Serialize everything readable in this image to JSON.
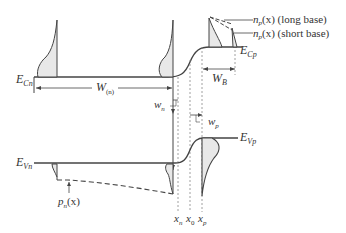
{
  "labels": {
    "ecn_main": "E",
    "ecn_sub": "Cn",
    "ecp_main": "E",
    "ecp_sub": "Cp",
    "evn_main": "E",
    "evn_sub": "Vn",
    "evp_main": "E",
    "evp_sub": "Vp",
    "wn_width_main": "W",
    "wn_width_sub": "(n)",
    "wb_main": "W",
    "wb_sub": "B",
    "wn_small_main": "w",
    "wn_small_sub": "n",
    "wp_small_main": "w",
    "wp_small_sub": "p",
    "pn_main": "p",
    "pn_sub": "n",
    "pn_arg": "(x)",
    "np_long_main": "n",
    "np_long_sub": "p",
    "np_long_arg": "(x) (long base)",
    "np_short_main": "n",
    "np_short_sub": "p",
    "np_short_arg": "(x) (short base)",
    "xn_main": "x",
    "xn_sub": "n",
    "x0_main": "x",
    "x0_sub": "0",
    "xp_main": "x",
    "xp_sub": "p"
  },
  "colors": {
    "line": "#444444",
    "fill": "#e8e8e8",
    "dotted": "#888888"
  }
}
